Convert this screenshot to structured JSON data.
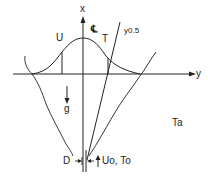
{
  "diagram": {
    "labels": {
      "x_axis": "x",
      "y_axis": "y",
      "centerline": "℄",
      "velocity": "U",
      "temperature": "T",
      "half_width": "y0.5",
      "gravity": "g",
      "ambient": "Ta",
      "diameter": "D",
      "source": "Uo, To"
    }
  }
}
